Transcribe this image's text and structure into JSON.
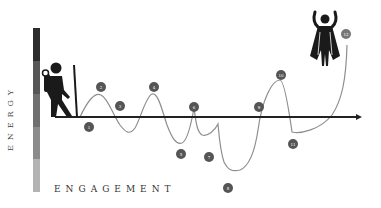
{
  "diagram": {
    "y_axis_label": "ENERGY",
    "x_axis_label": "ENGAGEMENT",
    "start_figure": "hiker-icon",
    "end_figure": "hero-cape-icon",
    "energy_bar_colors": [
      "#2b2b2b",
      "#555555",
      "#6e6e6e",
      "#8a8a8a",
      "#b0b0b0"
    ],
    "curve_color": "#8a8a8a",
    "axis_color": "#222222",
    "marker_color": "#555555",
    "markers": [
      {
        "label": "1",
        "x": 89,
        "y": 127
      },
      {
        "label": "2",
        "x": 101,
        "y": 87
      },
      {
        "label": "3",
        "x": 120,
        "y": 106
      },
      {
        "label": "4",
        "x": 154,
        "y": 87
      },
      {
        "label": "5",
        "x": 181,
        "y": 154
      },
      {
        "label": "6",
        "x": 194,
        "y": 107
      },
      {
        "label": "7",
        "x": 209,
        "y": 157
      },
      {
        "label": "8",
        "x": 228,
        "y": 188
      },
      {
        "label": "9",
        "x": 259,
        "y": 107
      },
      {
        "label": "10",
        "x": 281,
        "y": 75
      },
      {
        "label": "11",
        "x": 293,
        "y": 144
      },
      {
        "label": "12",
        "x": 346,
        "y": 34
      }
    ]
  }
}
